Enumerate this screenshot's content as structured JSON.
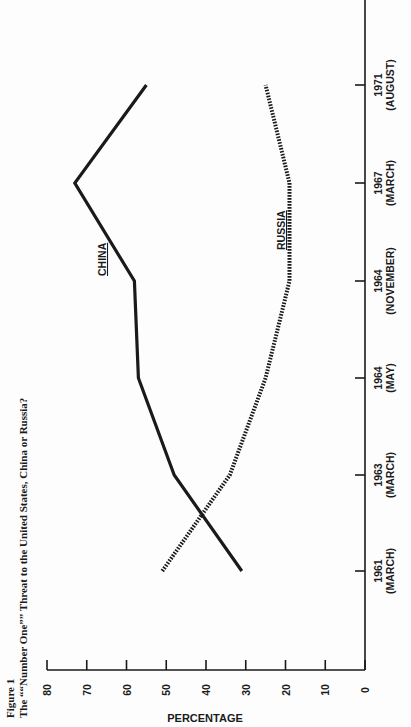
{
  "figure": {
    "label": "Figure 1",
    "title": "The ““Number One”” Threat to the United States, China or Russia?"
  },
  "chart_data": {
    "type": "line",
    "orientation": "rotated 90° counter-clockwise on page",
    "xlabel": "",
    "ylabel": "PERCENTAGE",
    "ylim": [
      0,
      80
    ],
    "yticks": [
      0,
      10,
      20,
      30,
      40,
      50,
      60,
      70,
      80
    ],
    "grid": false,
    "legend": "inline labels on lines",
    "categories": [
      {
        "year": "1961",
        "month": "(MARCH)"
      },
      {
        "year": "1963",
        "month": "(MARCH)"
      },
      {
        "year": "1964",
        "month": "(MAY)"
      },
      {
        "year": "1964",
        "month": "(NOVEMBER)"
      },
      {
        "year": "1967",
        "month": "(MARCH)"
      },
      {
        "year": "1971",
        "month": "(AUGUST)"
      }
    ],
    "series": [
      {
        "name": "CHINA",
        "style": "solid",
        "values": [
          31,
          48,
          57,
          58,
          73,
          55
        ]
      },
      {
        "name": "RUSSIA",
        "style": "dotted",
        "values": [
          51,
          34,
          25,
          19,
          19,
          25
        ]
      }
    ]
  },
  "colors": {
    "ink": "#1a1a1a",
    "paper": "#fdfdfd"
  }
}
